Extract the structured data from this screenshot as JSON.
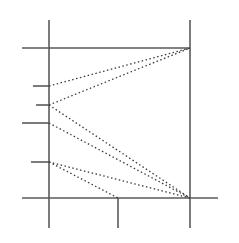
{
  "figure": {
    "title": "",
    "canvas": {
      "width": 239,
      "height": 243,
      "background": "#ffffff"
    },
    "style": {
      "axis_color": "#5a5a5a",
      "axis_width": 1.6,
      "tick_color": "#5a5a5a",
      "tick_width": 1.6,
      "connector_color": "#3a3a3a",
      "connector_width": 1.3,
      "connector_dash": "1.5 2.5"
    }
  },
  "chart_data": {
    "type": "line",
    "title": "",
    "subtitle": "",
    "xlabel": "",
    "ylabel": "",
    "grid": true,
    "legend": "none",
    "xlim": [
      0,
      239
    ],
    "ylim": [
      0,
      243
    ],
    "tick_labels": {
      "x": [],
      "y": []
    },
    "annotations": [],
    "axes": [
      {
        "name": "left-vertical-axis",
        "orientation": "vertical",
        "x": 49,
        "y1": 20,
        "y2": 228
      },
      {
        "name": "right-vertical-axis",
        "orientation": "vertical",
        "x": 190,
        "y1": 20,
        "y2": 228
      },
      {
        "name": "middle-bottom-vertical-axis",
        "orientation": "vertical",
        "x": 118,
        "y1": 198,
        "y2": 228
      },
      {
        "name": "top-horizontal-axis",
        "orientation": "horizontal",
        "y": 48,
        "x1": 22,
        "x2": 190
      },
      {
        "name": "bottom-horizontal-axis",
        "orientation": "horizontal",
        "y": 198,
        "x1": 22,
        "x2": 218
      }
    ],
    "ticks": [
      {
        "name": "tick-1",
        "axis": "left-vertical-axis",
        "y": 86,
        "x1": 33,
        "x2": 49,
        "length": 16
      },
      {
        "name": "tick-2",
        "axis": "left-vertical-axis",
        "y": 105,
        "x1": 36,
        "x2": 49,
        "length": 13
      },
      {
        "name": "tick-3",
        "axis": "left-vertical-axis",
        "y": 123,
        "x1": 22,
        "x2": 49,
        "length": 27
      },
      {
        "name": "tick-4",
        "axis": "left-vertical-axis",
        "y": 162,
        "x1": 31,
        "x2": 49,
        "length": 18
      }
    ],
    "nodes": [
      {
        "name": "node-top-right",
        "x": 190,
        "y": 48
      },
      {
        "name": "node-bottom-right",
        "x": 190,
        "y": 198
      },
      {
        "name": "node-bottom-middle",
        "x": 118,
        "y": 198
      },
      {
        "name": "node-left-a",
        "x": 49,
        "y": 86
      },
      {
        "name": "node-left-b",
        "x": 49,
        "y": 105
      },
      {
        "name": "node-left-c",
        "x": 49,
        "y": 123
      },
      {
        "name": "node-left-d",
        "x": 49,
        "y": 162
      }
    ],
    "connectors": [
      {
        "name": "connector-a-topright",
        "from": "node-left-a",
        "to": "node-top-right",
        "x1": 49,
        "y1": 86,
        "x2": 190,
        "y2": 48,
        "style": "dotted"
      },
      {
        "name": "connector-b-topright",
        "from": "node-left-b",
        "to": "node-top-right",
        "x1": 49,
        "y1": 105,
        "x2": 190,
        "y2": 48,
        "style": "dotted"
      },
      {
        "name": "connector-b-bottomright",
        "from": "node-left-b",
        "to": "node-bottom-right",
        "x1": 49,
        "y1": 105,
        "x2": 190,
        "y2": 198,
        "style": "dotted"
      },
      {
        "name": "connector-c-bottomright",
        "from": "node-left-c",
        "to": "node-bottom-right",
        "x1": 49,
        "y1": 123,
        "x2": 190,
        "y2": 198,
        "style": "dotted"
      },
      {
        "name": "connector-d-bottomright",
        "from": "node-left-d",
        "to": "node-bottom-right",
        "x1": 49,
        "y1": 162,
        "x2": 190,
        "y2": 198,
        "style": "dotted"
      },
      {
        "name": "connector-d-bottommiddle",
        "from": "node-left-d",
        "to": "node-bottom-middle",
        "x1": 49,
        "y1": 162,
        "x2": 118,
        "y2": 198,
        "style": "dotted"
      }
    ]
  }
}
